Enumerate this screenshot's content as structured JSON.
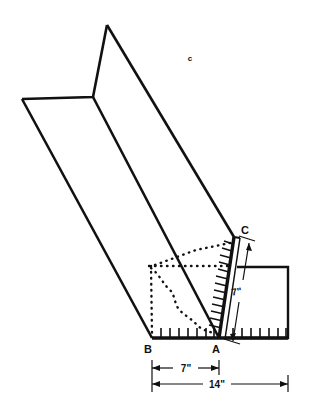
{
  "figure": {
    "type": "technical-line-drawing",
    "background_color": "#ffffff",
    "line_color": "#111111"
  },
  "labels": {
    "vertex_a": "A",
    "vertex_b": "B",
    "vertex_c_upper": "C",
    "callout_c": "c"
  },
  "dimensions": {
    "diagonal_ca": "7\"",
    "baseline_ba": "7\"",
    "baseline_total": "14\""
  },
  "geometry": {
    "top_fold_apex": [
      107,
      25
    ],
    "left_flange_tip": [
      22,
      99
    ],
    "fold_junction": [
      93,
      97
    ],
    "vertex_b": [
      152,
      338
    ],
    "vertex_a": [
      219,
      338
    ],
    "vertex_c": [
      234,
      237
    ],
    "right_panel": {
      "x": 240,
      "y": 267,
      "width": 48,
      "height": 71
    }
  },
  "scales": {
    "baseline_left_ticks": 7,
    "baseline_right_ticks": 7,
    "diagonal_hatch_marks": 13
  }
}
